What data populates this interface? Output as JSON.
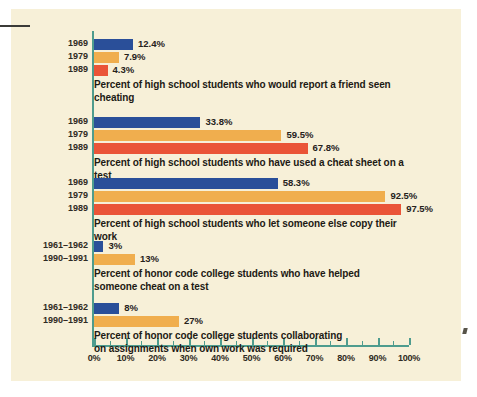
{
  "chart_data": {
    "type": "bar",
    "orientation": "horizontal",
    "title": "",
    "xlabel": "",
    "ylabel": "",
    "xlim": [
      0,
      100
    ],
    "xtick_labels": [
      "0%",
      "10%",
      "20%",
      "30%",
      "40%",
      "50%",
      "60%",
      "70%",
      "80%",
      "90%",
      "100%"
    ],
    "xtick_values": [
      0,
      10,
      20,
      30,
      40,
      50,
      60,
      70,
      80,
      90,
      100
    ],
    "minor_tick_step": 5,
    "grid": false,
    "legend": "none",
    "value_suffix": "%",
    "colors": {
      "series_1": "#2a4f99",
      "series_2": "#f0ae4e",
      "series_3": "#ea5437",
      "axis": "#4e9c8e",
      "card_background": "#f7f0d8",
      "page_background": "#ffffff",
      "text": "#1d1a14"
    },
    "groups": [
      {
        "caption": "Percent of high school students who would report a friend seen cheating",
        "categories": [
          "1969",
          "1979",
          "1989"
        ],
        "values": [
          12.4,
          7.9,
          4.3
        ],
        "value_labels": [
          "12.4%",
          "7.9%",
          "4.3%"
        ]
      },
      {
        "caption": "Percent of high school students who have used a cheat sheet on a test",
        "categories": [
          "1969",
          "1979",
          "1989"
        ],
        "values": [
          33.8,
          59.5,
          67.8
        ],
        "value_labels": [
          "33.8%",
          "59.5%",
          "67.8%"
        ]
      },
      {
        "caption": "Percent of high school students who let someone else copy their work",
        "categories": [
          "1969",
          "1979",
          "1989"
        ],
        "values": [
          58.3,
          92.5,
          97.5
        ],
        "value_labels": [
          "58.3%",
          "92.5%",
          "97.5%"
        ]
      },
      {
        "caption": "Percent of honor code college students who have helped\nsomeone cheat on a test",
        "categories": [
          "1961–1962",
          "1990–1991"
        ],
        "values": [
          3,
          13
        ],
        "value_labels": [
          "3%",
          "13%"
        ]
      },
      {
        "caption": "Percent of honor code college students collaborating\non assignments when own work was required",
        "categories": [
          "1961–1962",
          "1990–1991"
        ],
        "values": [
          8,
          27
        ],
        "value_labels": [
          "8%",
          "27%"
        ]
      }
    ]
  }
}
